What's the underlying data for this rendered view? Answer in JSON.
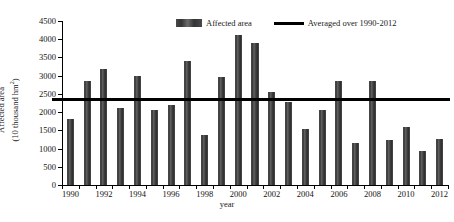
{
  "caption_sliver": "",
  "chart_data": {
    "type": "bar",
    "title": "",
    "xlabel": "year",
    "ylabel": "Affected area (10 thousand hm2)",
    "ylabel_line1": "Affected area",
    "ylabel_line2": "(10 thousand hm",
    "ylabel_sup": "2",
    "ylabel_line2_close": ")",
    "ylim": [
      0,
      4500
    ],
    "ytick_step": 500,
    "yticks": [
      0,
      500,
      1000,
      1500,
      2000,
      2500,
      3000,
      3500,
      4000,
      4500
    ],
    "ytick_labels": [
      "0",
      "500",
      "1000",
      "1500",
      "2000",
      "2500",
      "3000",
      "3500",
      "4000",
      "4500"
    ],
    "categories": [
      1990,
      1991,
      1992,
      1993,
      1994,
      1995,
      1996,
      1997,
      1998,
      1999,
      2000,
      2001,
      2002,
      2003,
      2004,
      2005,
      2006,
      2007,
      2008,
      2009,
      2010,
      2011,
      2012
    ],
    "xtick_labels": [
      "1990",
      "1992",
      "1994",
      "1996",
      "1998",
      "2000",
      "2002",
      "2004",
      "2006",
      "2008",
      "2010",
      "2012"
    ],
    "xtick_years": [
      1990,
      1992,
      1994,
      1996,
      1998,
      2000,
      2002,
      2004,
      2006,
      2008,
      2010,
      2012
    ],
    "series": [
      {
        "name": "Affected area",
        "color": "#3c3c3c",
        "values": [
          1810,
          2860,
          3170,
          2120,
          3000,
          2050,
          2200,
          3390,
          1370,
          2970,
          4110,
          3890,
          2550,
          2280,
          1540,
          2060,
          2860,
          1160,
          2860,
          1240,
          1580,
          930,
          1270
        ]
      }
    ],
    "reference_line": {
      "name": "Averaged over 1990-2012",
      "value": 2350,
      "color": "#000000"
    },
    "grid": false,
    "legend_position": "top-center"
  },
  "legend": {
    "bar_label": "Affected area",
    "line_label": "Averaged over 1990-2012"
  }
}
